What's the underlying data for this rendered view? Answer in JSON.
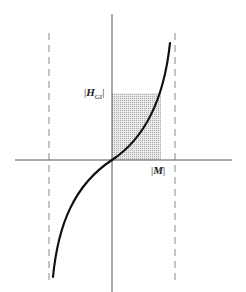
{
  "diagram": {
    "type": "magnetization curve with shaded area",
    "labels": {
      "y_marker": {
        "bar_open": "|",
        "symbol": "H",
        "subscript": "GI",
        "bar_close": "|"
      },
      "x_marker": {
        "bar_open": "|",
        "symbol": "M",
        "bar_close": "|"
      }
    },
    "colors": {
      "axis": "#555555",
      "curve": "#111111",
      "dashed": "#888888",
      "shade": "#c8c8c8"
    },
    "geometry": {
      "origin": [
        112,
        160
      ],
      "shade_rect": {
        "x0": 112,
        "x1": 161,
        "y_top": 93,
        "y_bottom": 160
      },
      "asymptotes_x": [
        49,
        175
      ]
    }
  }
}
